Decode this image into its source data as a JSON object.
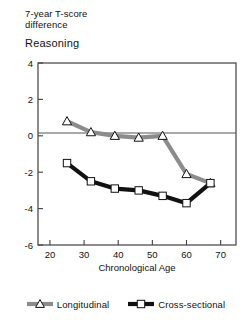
{
  "header": {
    "line1": "7-year T-score",
    "line2": "difference",
    "subtitle": "Reasoning"
  },
  "axes": {
    "xlabel": "Chronological Age",
    "xticks": [
      "20",
      "30",
      "40",
      "50",
      "60",
      "70"
    ],
    "yticks": [
      "4",
      "2",
      "0",
      "-2",
      "-4",
      "-6"
    ]
  },
  "legend": {
    "items": [
      {
        "label": "Longitudinal",
        "color": "#8c8c8c",
        "marker": "triangle"
      },
      {
        "label": "Cross-sectional",
        "color": "#111111",
        "marker": "square"
      }
    ]
  },
  "colors": {
    "longitudinal": "#8c8c8c",
    "cross_sectional": "#111111",
    "axis": "#404040",
    "zero_line": "#555555"
  },
  "chart_data": {
    "type": "line",
    "title": "Reasoning",
    "subtitle": "7-year T-score difference",
    "xlabel": "Chronological Age",
    "ylabel": "",
    "xlim": [
      16.5,
      74.5
    ],
    "ylim": [
      -6,
      4
    ],
    "grid": false,
    "zero_line": true,
    "legend_position": "below",
    "series": [
      {
        "name": "Longitudinal",
        "marker": "triangle",
        "color": "#8c8c8c",
        "x": [
          25,
          32,
          39,
          46,
          53,
          60,
          67
        ],
        "y": [
          0.8,
          0.2,
          0.0,
          -0.1,
          0.0,
          -2.1,
          -2.6
        ]
      },
      {
        "name": "Cross-sectional",
        "marker": "square",
        "color": "#111111",
        "x": [
          25,
          32,
          39,
          46,
          53,
          60,
          67
        ],
        "y": [
          -1.5,
          -2.5,
          -2.9,
          -3.0,
          -3.3,
          -3.7,
          -2.6
        ]
      }
    ]
  }
}
